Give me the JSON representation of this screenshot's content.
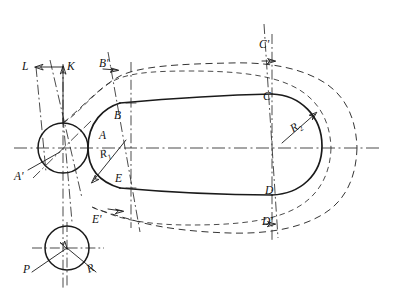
{
  "drawing": {
    "title": "Rounded-slot cam profile layout",
    "stroke_color": "#1a1a1a",
    "background": "#ffffff",
    "labels": [
      {
        "id": "L",
        "text": "L",
        "x": 22,
        "y": 61,
        "kind": "dimension-arrow-label"
      },
      {
        "id": "K",
        "text": "K",
        "x": 67,
        "y": 61,
        "kind": "dimension-arrow-label"
      },
      {
        "id": "Bp",
        "text": "B'",
        "x": 99,
        "y": 58,
        "kind": "offset-point-label"
      },
      {
        "id": "Cp",
        "text": "C'",
        "x": 259,
        "y": 39,
        "kind": "offset-point-label"
      },
      {
        "id": "B",
        "text": "B",
        "x": 114,
        "y": 110,
        "kind": "profile-point-label"
      },
      {
        "id": "C",
        "text": "C",
        "x": 263,
        "y": 91,
        "kind": "profile-point-label"
      },
      {
        "id": "A",
        "text": "A",
        "x": 99,
        "y": 130,
        "kind": "profile-point-label"
      },
      {
        "id": "Ap",
        "text": "A'",
        "x": 14,
        "y": 171,
        "kind": "offset-point-label"
      },
      {
        "id": "E",
        "text": "E",
        "x": 115,
        "y": 173,
        "kind": "profile-point-label"
      },
      {
        "id": "Ep",
        "text": "E'",
        "x": 92,
        "y": 214,
        "kind": "offset-point-label"
      },
      {
        "id": "D",
        "text": "D",
        "x": 265,
        "y": 185,
        "kind": "profile-point-label"
      },
      {
        "id": "Dp",
        "text": "D'",
        "x": 262,
        "y": 216,
        "kind": "offset-point-label"
      },
      {
        "id": "P",
        "text": "P",
        "x": 23,
        "y": 264,
        "kind": "vector-label"
      },
      {
        "id": "R",
        "text": "R",
        "x": 87,
        "y": 263,
        "kind": "vector-label"
      }
    ],
    "radius_labels": [
      {
        "id": "R1",
        "base": "R",
        "sub": "1",
        "x": 100,
        "y": 148,
        "kind": "radius-dimension"
      },
      {
        "id": "R2",
        "base": "R",
        "sub": "2",
        "x": 291,
        "y": 121,
        "kind": "radius-dimension"
      }
    ],
    "geometry": {
      "centerline_y": 148,
      "left_circle": {
        "cx": 63,
        "cy": 148,
        "r": 25
      },
      "bottom_circle": {
        "cx": 67,
        "cy": 248,
        "r": 22
      },
      "arc_R1": {
        "cx": 131,
        "cy": 148,
        "r": 45
      },
      "arc_R2": {
        "cx": 290,
        "cy": 148,
        "r": 52
      },
      "top_edge": {
        "x1": 120,
        "y1": 103,
        "x2": 272,
        "y2": 94
      },
      "bottom_edge": {
        "x1": 120,
        "y1": 188,
        "x2": 272,
        "y2": 195
      }
    }
  }
}
